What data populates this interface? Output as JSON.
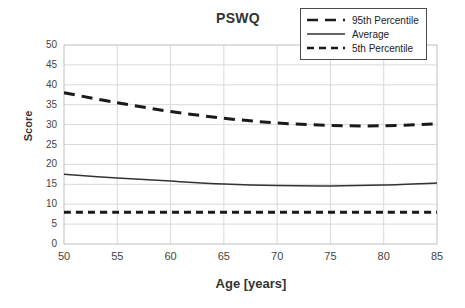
{
  "chart_data": {
    "type": "line",
    "title": "PSWQ",
    "xlabel": "Age [years]",
    "ylabel": "Score",
    "xlim": [
      50,
      85
    ],
    "ylim": [
      0,
      50
    ],
    "xticks": [
      50,
      55,
      60,
      65,
      70,
      75,
      80,
      85
    ],
    "yticks": [
      0,
      5,
      10,
      15,
      20,
      25,
      30,
      35,
      40,
      45,
      50
    ],
    "grid": true,
    "legend_position": "top-right",
    "x": [
      50,
      55,
      60,
      65,
      70,
      75,
      80,
      85
    ],
    "series": [
      {
        "name": "95th Percentile",
        "style": "dashed-long",
        "color": "#1a1a1a",
        "values": [
          38.0,
          35.5,
          33.3,
          31.6,
          30.4,
          29.8,
          29.7,
          30.2
        ]
      },
      {
        "name": "Average",
        "style": "solid",
        "color": "#333333",
        "values": [
          17.5,
          16.6,
          15.8,
          15.1,
          14.7,
          14.6,
          14.8,
          15.3
        ]
      },
      {
        "name": "5th Percentile",
        "style": "dashed-short",
        "color": "#1a1a1a",
        "values": [
          8.0,
          8.0,
          8.0,
          8.0,
          8.0,
          8.0,
          8.0,
          8.0
        ]
      }
    ]
  },
  "legend": {
    "items": [
      {
        "label": "95th Percentile"
      },
      {
        "label": "Average"
      },
      {
        "label": "5th Percentile"
      }
    ]
  },
  "colors": {
    "series_dark": "#1a1a1a",
    "grid": "#d9d9d9",
    "axis": "#bfbfbf",
    "text": "#333333"
  }
}
